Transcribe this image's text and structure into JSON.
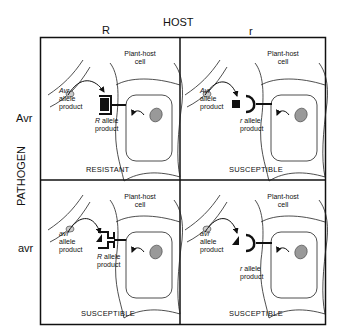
{
  "header": {
    "title": "HOST",
    "col_labels": [
      "R",
      "r"
    ]
  },
  "side": {
    "title": "PATHOGEN",
    "row_labels": [
      "Avr",
      "avr"
    ]
  },
  "cells": [
    {
      "host_cell_label": "Plant-host\ncell",
      "pathogen_product": "Avr\nallele\nproduct",
      "host_product": "R allele\nproduct",
      "outcome": "RESISTANT"
    },
    {
      "host_cell_label": "Plant-host\ncell",
      "pathogen_product": "Avr\nallele\nproduct",
      "host_product": "r allele\nproduct",
      "outcome": "SUSCEPTIBLE"
    },
    {
      "host_cell_label": "Plant-host\ncell",
      "pathogen_product": "avr\nallele\nproduct",
      "host_product": "R allele\nproduct",
      "outcome": "SUSCEPTIBLE"
    },
    {
      "host_cell_label": "Plant-host\ncell",
      "pathogen_product": "avr\nallele\nproduct",
      "host_product": "r allele\nproduct",
      "outcome": "SUSCEPTIBLE"
    }
  ],
  "labels": {
    "plant_host_1": "Plant-host",
    "cell_1": "cell",
    "avr_cap": "Avr",
    "avr_low": "avr",
    "allele": "allele",
    "product": "product",
    "R_italic": "R",
    "r_italic": "r",
    "allele_suffix": " allele"
  }
}
